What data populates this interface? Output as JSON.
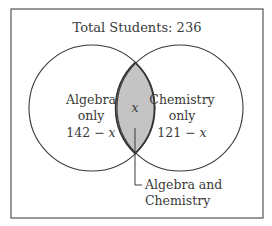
{
  "diagram": {
    "type": "venn",
    "title": "Total Students: 236",
    "total": 236,
    "sets": [
      {
        "name": "Algebra",
        "label_line1": "Algebra",
        "label_line2": "only",
        "value_number": "142",
        "value_op": " − ",
        "value_var": "x"
      },
      {
        "name": "Chemistry",
        "label_line1": "Chemistry",
        "label_line2": "only",
        "value_number": "121",
        "value_op": " − ",
        "value_var": "x"
      }
    ],
    "intersection": {
      "value_var": "x",
      "callout_line1": "Algebra and",
      "callout_line2": "Chemistry",
      "fill": "#c4c4c4"
    },
    "colors": {
      "stroke": "#3a3a3a",
      "frame": "#555555",
      "background": "#ffffff"
    }
  }
}
